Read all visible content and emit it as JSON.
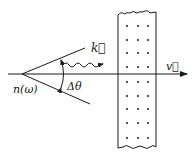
{
  "diagram": {
    "type": "physics-schematic",
    "labels": {
      "wave_vector": "k⃗",
      "angle": "Δθ",
      "refractive_index": "n(ω)",
      "velocity": "v⃗"
    },
    "colors": {
      "ink": "#1a1a1a",
      "background": "#ffffff"
    },
    "slab": {
      "dot_columns": 3,
      "dot_rows": 9
    }
  }
}
